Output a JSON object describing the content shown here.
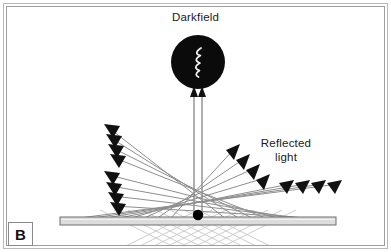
{
  "figure": {
    "panel_label": "B",
    "title_label": "Darkfield",
    "reflected_label_line1": "Reflected",
    "reflected_label_line2": "light",
    "width": 391,
    "height": 252
  },
  "colors": {
    "background": "#ffffff",
    "frame_outer": "#b9b9b9",
    "frame_inner": "#9e9e9e",
    "objective_fill": "#0b0b0b",
    "ray_line": "#8e8e8e",
    "ray_line_below": "#bdbdbd",
    "arrow_head": "#111111",
    "slide_fill": "#dcdcdc",
    "slide_stroke": "#6f6f6f",
    "specimen_dot": "#000000",
    "squiggle": "#f2f2f2",
    "text": "#1a1a1a"
  },
  "objective": {
    "name": "darkfield-objective",
    "cx": 198,
    "cy": 62,
    "r": 27,
    "squiggle_description": "white-zigzag-wave"
  },
  "specimen": {
    "name": "specimen-dot",
    "cx": 198,
    "cy": 216,
    "r": 5.2
  },
  "slide": {
    "name": "microscope-slide",
    "x": 60,
    "y": 217,
    "width": 276,
    "height": 8
  },
  "vertical_rays": [
    {
      "name": "vertical-ray-left",
      "x": 194,
      "y_bottom": 216,
      "y_top": 90
    },
    {
      "name": "vertical-ray-right",
      "x": 202,
      "y_bottom": 216,
      "y_top": 90
    }
  ],
  "ray_groups": [
    {
      "name": "left-upper-reflected-rays",
      "direction": "up-left",
      "count": 4,
      "arrow_points": "left"
    },
    {
      "name": "left-lower-reflected-rays",
      "direction": "up-left",
      "count": 4,
      "arrow_points": "left"
    },
    {
      "name": "right-upper-reflected-rays",
      "direction": "up-right",
      "count": 4,
      "arrow_points": "right"
    },
    {
      "name": "right-lower-reflected-rays",
      "direction": "up-right",
      "count": 4,
      "arrow_points": "right"
    }
  ]
}
